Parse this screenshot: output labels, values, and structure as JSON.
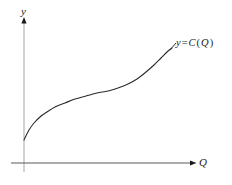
{
  "figure": {
    "background_color": "#ffffff",
    "width": 232,
    "height": 185
  },
  "axes": {
    "y_axis": {
      "label": "y",
      "color": "#b4b4b4",
      "x": 24,
      "top": 20,
      "bottom": 172,
      "arrow_color": "#1a1a1a"
    },
    "x_axis": {
      "label": "Q",
      "color": "#5a5a5a",
      "y": 163,
      "left": 11,
      "right": 193,
      "arrow_color": "#1a1a1a"
    }
  },
  "curve_label": {
    "y_var": "y",
    "equals": "=",
    "function_name": "C",
    "open_paren": "(",
    "argument": "Q",
    "close_paren": ")",
    "full_text": "y = C(Q)"
  },
  "chart_data": {
    "type": "line",
    "title": "",
    "subtitle": "",
    "xlabel": "Q",
    "ylabel": "y",
    "grid": false,
    "legend": null,
    "annotations": [
      {
        "text": "y = C(Q)",
        "x_px": 176,
        "y_px": 38,
        "describes": "total cost curve"
      }
    ],
    "axis_ranges": {
      "x_px": [
        24,
        193
      ],
      "y_px": [
        20,
        163
      ]
    },
    "series": [
      {
        "name": "y = C(Q)",
        "color": "#2b2b2b",
        "stroke_width": 1.1,
        "description": "S-shaped total cost curve: positive intercept, concave then convex through an inflection point",
        "points_px": [
          [
            24,
            140
          ],
          [
            29,
            130
          ],
          [
            34,
            123
          ],
          [
            40,
            117
          ],
          [
            47,
            112
          ],
          [
            55,
            107
          ],
          [
            65,
            103
          ],
          [
            75,
            99
          ],
          [
            86,
            96
          ],
          [
            97,
            93
          ],
          [
            108,
            91
          ],
          [
            118,
            88
          ],
          [
            128,
            84
          ],
          [
            137,
            79
          ],
          [
            146,
            72
          ],
          [
            154,
            65
          ],
          [
            161,
            58
          ],
          [
            167,
            52
          ],
          [
            172,
            48
          ]
        ]
      }
    ]
  }
}
